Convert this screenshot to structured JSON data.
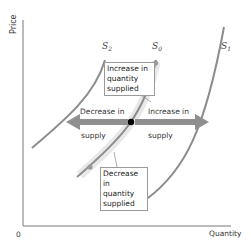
{
  "axes": {
    "y_label": "Price",
    "x_label": "Quantity",
    "origin_label": "0"
  },
  "curves": {
    "s0": {
      "name": "S",
      "sub": "0"
    },
    "s1": {
      "name": "S",
      "sub": "1"
    },
    "s2": {
      "name": "S",
      "sub": "2"
    }
  },
  "boxes": {
    "increase_qs": [
      "Increase in",
      "quantity",
      "supplied"
    ],
    "decrease_qs": [
      "Decrease in",
      "quantity",
      "supplied"
    ]
  },
  "arrows": {
    "decrease_supply": {
      "line1": "Decrease in",
      "line2": "supply"
    },
    "increase_supply": {
      "line1": "Increase in",
      "line2": "supply"
    }
  },
  "colors": {
    "curve": "#8c8c8c",
    "arrow": "#8f8f8f",
    "axis": "#777777",
    "point": "#000000",
    "highlight": "#e6e6e6"
  }
}
